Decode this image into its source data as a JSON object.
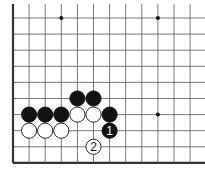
{
  "diagram": {
    "type": "go-board-corner",
    "grid": {
      "origin_x": 13,
      "origin_y": 18,
      "spacing": 16.1,
      "cols": 12,
      "rows": 10,
      "edges": [
        "left",
        "bottom"
      ],
      "line_color": "#555555",
      "edge_color": "#333333"
    },
    "star_points": [
      {
        "col": 3,
        "row": 0
      },
      {
        "col": 9,
        "row": 0
      },
      {
        "col": 9,
        "row": 6
      }
    ],
    "stones": [
      {
        "color": "black",
        "col": 1,
        "row": 6,
        "label": ""
      },
      {
        "color": "black",
        "col": 2,
        "row": 6,
        "label": ""
      },
      {
        "color": "black",
        "col": 3,
        "row": 6,
        "label": ""
      },
      {
        "color": "black",
        "col": 4,
        "row": 5,
        "label": ""
      },
      {
        "color": "black",
        "col": 5,
        "row": 5,
        "label": ""
      },
      {
        "color": "black",
        "col": 6,
        "row": 6,
        "label": ""
      },
      {
        "color": "black",
        "col": 6,
        "row": 7,
        "label": "1"
      },
      {
        "color": "white",
        "col": 1,
        "row": 7,
        "label": ""
      },
      {
        "color": "white",
        "col": 2,
        "row": 7,
        "label": ""
      },
      {
        "color": "white",
        "col": 3,
        "row": 7,
        "label": ""
      },
      {
        "color": "white",
        "col": 4,
        "row": 6,
        "label": ""
      },
      {
        "color": "white",
        "col": 5,
        "row": 6,
        "label": ""
      },
      {
        "color": "white",
        "col": 5,
        "row": 8,
        "label": "2"
      }
    ],
    "move_labels": [
      "1",
      "2"
    ]
  }
}
